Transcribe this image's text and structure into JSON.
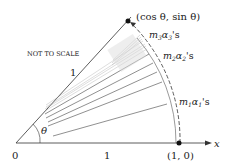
{
  "diagram": {
    "point_top_label": "(cos θ, sin θ)",
    "point_right_label": "(1, 0)",
    "origin_label": "0",
    "x_axis_label": "x",
    "radius_label_upper": "1",
    "radius_label_lower": "1",
    "angle_label": "θ",
    "note": "NOT TO SCALE",
    "group_labels": [
      {
        "m": "m",
        "sub": "3",
        "a": "α",
        "asub": "3",
        "suffix": "'s"
      },
      {
        "m": "m",
        "sub": "2",
        "a": "α",
        "asub": "2",
        "suffix": "'s"
      },
      {
        "m": "m",
        "sub": "1",
        "a": "α",
        "asub": "1",
        "suffix": "'s"
      }
    ],
    "colors": {
      "line": "#333333",
      "light_line": "#999999",
      "dot": "#111111"
    }
  }
}
